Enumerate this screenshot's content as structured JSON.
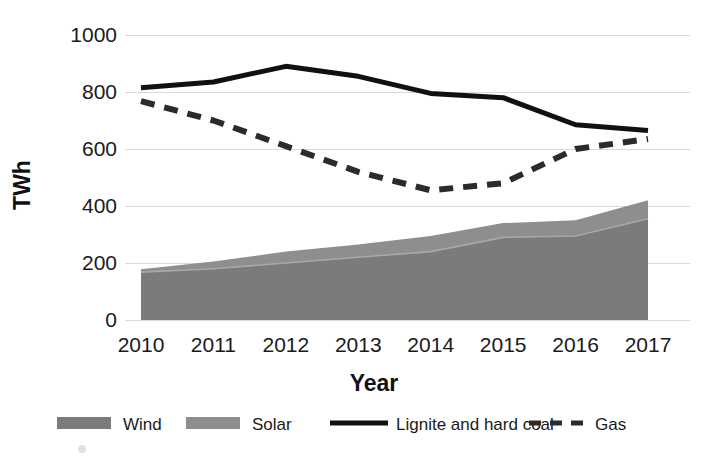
{
  "chart_data": {
    "type": "area",
    "title": "",
    "xlabel": "Year",
    "ylabel": "TWh",
    "categories": [
      "2010",
      "2011",
      "2012",
      "2013",
      "2014",
      "2015",
      "2016",
      "2017"
    ],
    "x": [
      2010,
      2011,
      2012,
      2013,
      2014,
      2015,
      2016,
      2017
    ],
    "ylim": [
      0,
      1000
    ],
    "xlim": [
      2010,
      2017
    ],
    "yticks": [
      0,
      200,
      400,
      600,
      800,
      1000
    ],
    "ytick_labels": [
      "0",
      "200",
      "400",
      "600",
      "800",
      "1000"
    ],
    "grid": "horizontal",
    "legend_position": "bottom",
    "series": [
      {
        "name": "Wind",
        "kind": "area-stacked",
        "color": "#7b7b7b",
        "values": [
          168,
          180,
          200,
          220,
          240,
          290,
          295,
          355
        ]
      },
      {
        "name": "Solar",
        "kind": "area-stacked",
        "color": "#8e8e8e",
        "values": [
          10,
          25,
          40,
          45,
          55,
          50,
          55,
          65
        ]
      },
      {
        "name": "Lignite and hard coal",
        "kind": "line-solid",
        "color": "#111111",
        "values": [
          815,
          835,
          890,
          855,
          795,
          780,
          685,
          665
        ]
      },
      {
        "name": "Gas",
        "kind": "line-dashed",
        "color": "#2b2b2b",
        "values": [
          768,
          700,
          610,
          520,
          455,
          480,
          600,
          635
        ]
      }
    ],
    "stacked_totals": [
      178,
      205,
      240,
      265,
      295,
      340,
      350,
      420
    ]
  },
  "legend": {
    "items": [
      {
        "label": "Wind",
        "marker": "swatch",
        "color": "#7b7b7b"
      },
      {
        "label": "Solar",
        "marker": "swatch",
        "color": "#8e8e8e"
      },
      {
        "label": "Lignite and hard coal",
        "marker": "line-solid",
        "color": "#111111"
      },
      {
        "label": "Gas",
        "marker": "line-dashed",
        "color": "#2b2b2b"
      }
    ]
  },
  "colors": {
    "background": "#ffffff",
    "gridline": "#d9d9d9",
    "text": "#1a1a1a",
    "wind": "#7b7b7b",
    "solar": "#8e8e8e",
    "coal": "#111111",
    "gas": "#2b2b2b"
  }
}
